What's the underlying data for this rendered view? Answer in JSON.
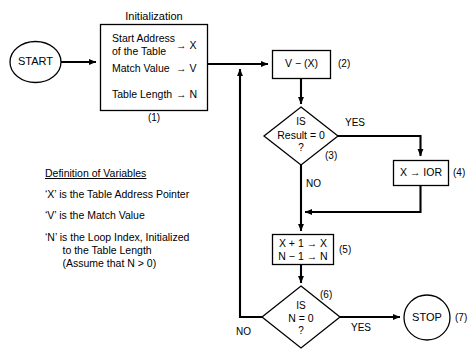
{
  "diagram": {
    "title_caption": "Initialization",
    "nodes": {
      "start": {
        "label": "START",
        "shape": "ellipse"
      },
      "init": {
        "caption": "Initialization",
        "rows": [
          {
            "text": "Start Address\nof the Table",
            "target": "→ X"
          },
          {
            "text": "Match Value",
            "target": "→ V"
          },
          {
            "text": "Table Length",
            "target": "→ N"
          }
        ],
        "step": "(1)"
      },
      "subtract": {
        "label": "V − (X)",
        "step": "(2)"
      },
      "decision_result": {
        "line1": "IS",
        "line2": "Result = 0",
        "line3": "?",
        "step": "(3)",
        "yes_label": "YES",
        "no_label": "NO"
      },
      "store_ior": {
        "label": "X → IOR",
        "step": "(4)"
      },
      "increment": {
        "line1": "X + 1 → X",
        "line2": "N − 1 → N",
        "step": "(5)"
      },
      "decision_n": {
        "line1": "IS",
        "line2": "N = 0",
        "line3": "?",
        "step": "(6)",
        "yes_label": "YES",
        "no_label": "NO"
      },
      "stop": {
        "label": "STOP",
        "shape": "ellipse",
        "step": "(7)"
      }
    },
    "legend": {
      "heading": "Definition of Variables",
      "lines": [
        "‘X’ is the Table Address Pointer",
        "‘V’ is the Match Value",
        "‘N’ is the Loop Index, Initialized",
        "      to the Table Length",
        "      (Assume that N > 0)"
      ]
    },
    "colors": {
      "stroke": "#000000",
      "background": "#ffffff",
      "text": "#000000"
    }
  }
}
